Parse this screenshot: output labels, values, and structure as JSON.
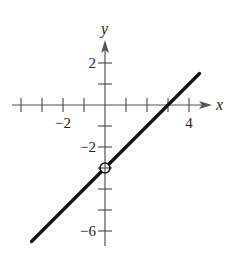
{
  "chart_data": {
    "type": "line",
    "title": "",
    "xlabel": "x",
    "ylabel": "y",
    "xlim": [
      -4,
      4.5
    ],
    "ylim": [
      -6,
      2.5
    ],
    "grid": false,
    "legend": "none",
    "x_ticks": [
      -4,
      -3,
      -2,
      -1,
      1,
      2,
      3,
      4
    ],
    "x_tick_labels": [
      {
        "value": -2,
        "text": "−2"
      },
      {
        "value": 4,
        "text": "4"
      }
    ],
    "y_ticks": [
      2,
      1,
      -1,
      -2,
      -3,
      -4,
      -5,
      -6
    ],
    "y_tick_labels": [
      {
        "value": 2,
        "text": "2"
      },
      {
        "value": -2,
        "text": "−2"
      },
      {
        "value": -6,
        "text": "−6"
      }
    ],
    "series": [
      {
        "name": "line",
        "equation": "y = x - 3",
        "x": [
          -3.5,
          4.5
        ],
        "y": [
          -6.5,
          1.5
        ]
      }
    ],
    "annotations": [
      {
        "type": "open-circle",
        "x": 0,
        "y": -3
      }
    ]
  }
}
